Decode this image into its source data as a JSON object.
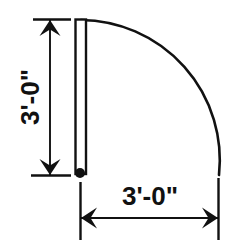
{
  "drawing": {
    "type": "architectural-door-swing-plan",
    "background_color": "#ffffff",
    "line_color": "#111111",
    "vertical_dimension": {
      "label": "3'-0\"",
      "orientation": "vertical",
      "text_rotation_deg": -90,
      "line_x": 50,
      "line_y_top": 20,
      "line_y_bottom": 174,
      "extension_top_y": 19,
      "extension_bottom_y": 175,
      "extension_x_start": 33,
      "extension_x_end": 71,
      "arrow_top": "arrow-up",
      "arrow_bottom": "arrow-down"
    },
    "horizontal_dimension": {
      "label": "3'-0\"",
      "orientation": "horizontal",
      "line_y": 218,
      "line_x_left": 80,
      "line_x_right": 219,
      "extension_left_x": 80,
      "extension_right_x": 219,
      "extension_y_start": 180,
      "extension_y_end": 240,
      "arrow_left": "arrow-left",
      "arrow_right": "arrow-right"
    },
    "door_panel": {
      "x_left": 75,
      "x_right": 87,
      "y_top": 19,
      "y_bottom": 174,
      "description": "door leaf shown in open position"
    },
    "hinge": {
      "cx": 80,
      "cy": 173,
      "r": 5,
      "description": "hinge pivot point"
    },
    "swing_arc": {
      "center_x": 80,
      "center_y": 174,
      "radius": 140,
      "start_angle_deg": 270,
      "sweep_deg": 90,
      "description": "90 degree door swing arc"
    }
  }
}
